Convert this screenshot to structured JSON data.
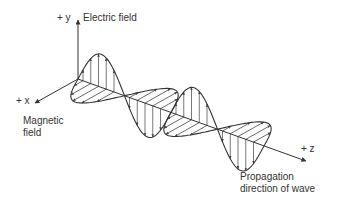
{
  "diagram": {
    "type": "electromagnetic-wave",
    "axes": {
      "y": {
        "label": "+ y"
      },
      "x": {
        "label": "+ x"
      },
      "z": {
        "label": "+ z"
      }
    },
    "labels": {
      "electric_field": "Electric field",
      "magnetic_field_line1": "Magnetic",
      "magnetic_field_line2": "field",
      "propagation_line1": "Propagation",
      "propagation_line2": "direction of wave"
    },
    "colors": {
      "stroke": "#333333",
      "background": "#ffffff"
    }
  }
}
